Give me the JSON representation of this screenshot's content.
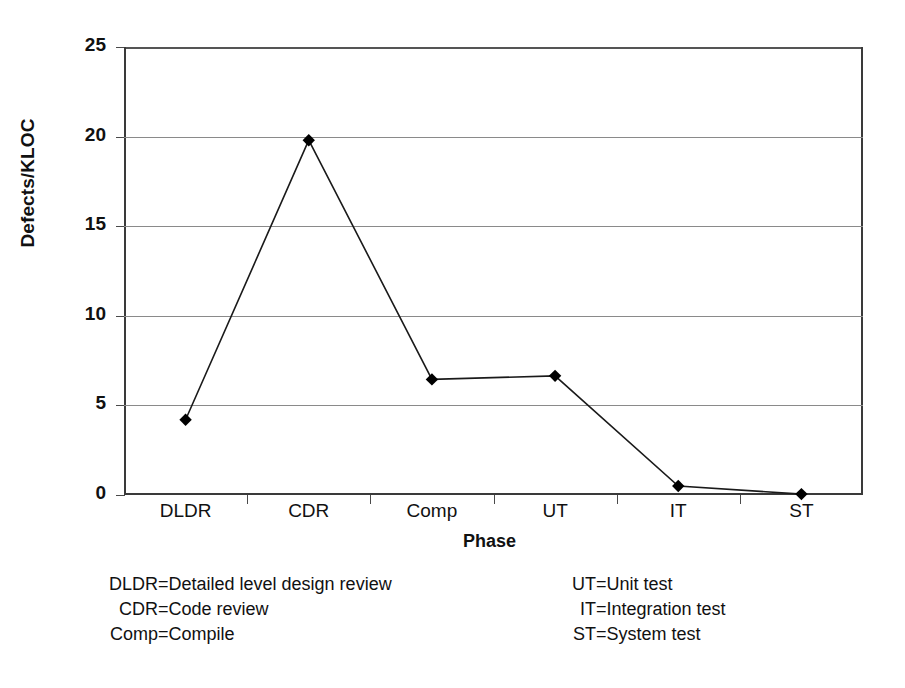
{
  "chart_data": {
    "type": "line",
    "title": "",
    "xlabel": "Phase",
    "ylabel": "Defects/KLOC",
    "categories": [
      "DLDR",
      "CDR",
      "Comp",
      "UT",
      "IT",
      "ST"
    ],
    "values": [
      4.2,
      19.8,
      6.45,
      6.65,
      0.5,
      0.05
    ],
    "series": [
      {
        "name": "Defects/KLOC",
        "values": [
          4.2,
          19.8,
          6.45,
          6.65,
          0.5,
          0.05
        ]
      }
    ],
    "ylim": [
      0,
      25
    ],
    "ytick_labels": [
      "0",
      "5",
      "10",
      "15",
      "20",
      "25"
    ],
    "ytick_values": [
      0,
      5,
      10,
      15,
      20,
      25
    ],
    "grid": "horizontal",
    "legend_position": "below-plot",
    "marker": "filled-diamond",
    "line_color": "#1a1a1a",
    "marker_color": "#000000",
    "grid_color": "#8a8a8a",
    "axis_color": "#3a3a3a",
    "background_color": "#ffffff"
  },
  "axes": {
    "y_title": "Defects/KLOC",
    "x_title": "Phase"
  },
  "legend": {
    "left_column": [
      {
        "abbr": "DLDR",
        "eq": "=",
        "text": "Detailed level design review"
      },
      {
        "abbr": "CDR",
        "eq": "=",
        "text": "Code review"
      },
      {
        "abbr": "Comp",
        "eq": "=",
        "text": "Compile"
      }
    ],
    "right_column": [
      {
        "abbr": "UT",
        "eq": "=",
        "text": "Unit test"
      },
      {
        "abbr": "IT",
        "eq": "=",
        "text": "Integration test"
      },
      {
        "abbr": "ST",
        "eq": "=",
        "text": "System test"
      }
    ]
  }
}
